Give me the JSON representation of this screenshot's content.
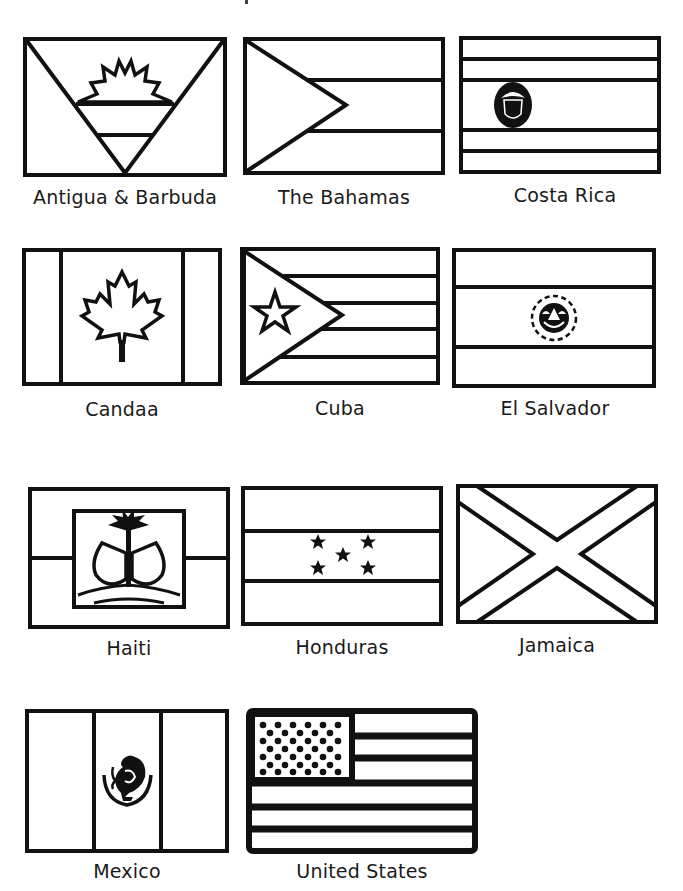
{
  "page": {
    "background": "#ffffff",
    "line_color": "#111111"
  },
  "flags": [
    {
      "id": "antigua",
      "label": "Antigua & Barbuda",
      "row": 1,
      "col": 1
    },
    {
      "id": "bahamas",
      "label": "The Bahamas",
      "row": 1,
      "col": 2
    },
    {
      "id": "costa-rica",
      "label": "Costa Rica",
      "row": 1,
      "col": 3
    },
    {
      "id": "canada",
      "label": "Candaa",
      "row": 2,
      "col": 1
    },
    {
      "id": "cuba",
      "label": "Cuba",
      "row": 2,
      "col": 2
    },
    {
      "id": "el-salvador",
      "label": "El Salvador",
      "row": 2,
      "col": 3
    },
    {
      "id": "haiti",
      "label": "Haiti",
      "row": 3,
      "col": 1
    },
    {
      "id": "honduras",
      "label": "Honduras",
      "row": 3,
      "col": 2
    },
    {
      "id": "jamaica",
      "label": "Jamaica",
      "row": 3,
      "col": 3
    },
    {
      "id": "mexico",
      "label": "Mexico",
      "row": 4,
      "col": 1
    },
    {
      "id": "united-states",
      "label": "United States",
      "row": 4,
      "col": 2
    }
  ]
}
